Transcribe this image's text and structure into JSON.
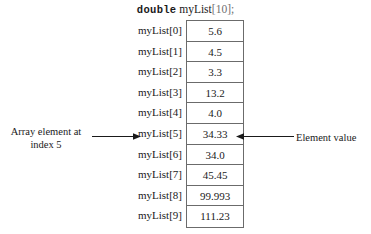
{
  "declaration": {
    "keyword": "double",
    "variable": "myList",
    "brackets": "[10];"
  },
  "array": {
    "labels": [
      "myList[0]",
      "myList[1]",
      "myList[2]",
      "myList[3]",
      "myList[4]",
      "myList[5]",
      "myList[6]",
      "myList[7]",
      "myList[8]",
      "myList[9]"
    ],
    "values": [
      "5.6",
      "4.5",
      "3.3",
      "13.2",
      "4.0",
      "34.33",
      "34.0",
      "45.45",
      "99.993",
      "111.23"
    ]
  },
  "annotations": {
    "left_line1": "Array element at",
    "left_line2": "index 5",
    "right": "Element value"
  },
  "colors": {
    "border": "#6b6b6b",
    "text": "#1a1a1a",
    "bracket": "#6f6f6f",
    "background": "#ffffff"
  }
}
